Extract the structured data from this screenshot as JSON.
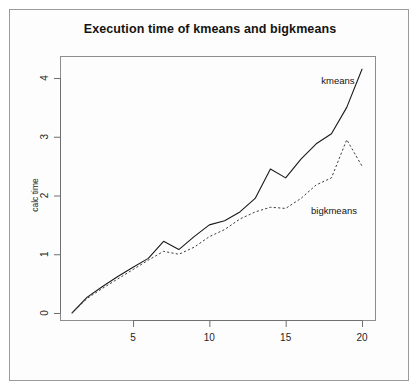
{
  "chart_data": {
    "type": "line",
    "title": "Execution time of kmeans and bigkmeans",
    "xlabel": "",
    "ylabel": "calc time",
    "xlim": [
      1,
      21
    ],
    "ylim": [
      -0.1,
      4.35
    ],
    "grid": false,
    "legend_position": "inline-annotations",
    "x_ticks": [
      5,
      10,
      15,
      20
    ],
    "y_ticks": [
      0,
      1,
      2,
      3,
      4
    ],
    "x": [
      1,
      2,
      3,
      4,
      5,
      6,
      7,
      8,
      9,
      10,
      11,
      12,
      13,
      14,
      15,
      16,
      17,
      18,
      19,
      20
    ],
    "series": [
      {
        "name": "kmeans",
        "style": "solid",
        "color": "#1a1a1a",
        "annotation": "kmeans",
        "values": [
          0.0,
          0.27,
          0.45,
          0.62,
          0.78,
          0.93,
          1.22,
          1.08,
          1.3,
          1.5,
          1.57,
          1.72,
          1.95,
          2.45,
          2.3,
          2.62,
          2.88,
          3.05,
          3.5,
          4.15
        ]
      },
      {
        "name": "bigkmeans",
        "style": "dashed",
        "color": "#3d3d3d",
        "annotation": "bigkmeans",
        "values": [
          0.0,
          0.25,
          0.42,
          0.58,
          0.74,
          0.9,
          1.05,
          1.0,
          1.12,
          1.3,
          1.42,
          1.6,
          1.72,
          1.8,
          1.78,
          1.95,
          2.18,
          2.3,
          2.95,
          2.5
        ]
      }
    ]
  },
  "annotations": {
    "kmeans_label": "kmeans",
    "bigkmeans_label": "bigkmeans"
  }
}
